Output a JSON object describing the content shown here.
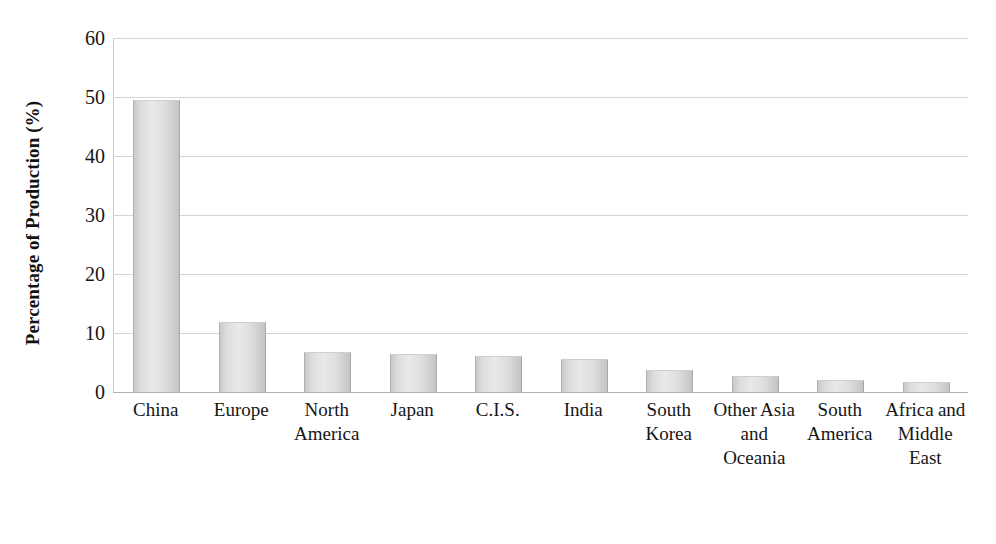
{
  "chart_data": {
    "type": "bar",
    "title": "",
    "subtitle": "",
    "xlabel": "",
    "ylabel": "Percentage of Production (%)",
    "categories": [
      "China",
      "Europe",
      "North America",
      "Japan",
      "C.I.S.",
      "India",
      "South Korea",
      "Other Asia and Oceania",
      "South America",
      "Africa and Middle East"
    ],
    "values": [
      49.3,
      11.7,
      6.6,
      6.2,
      5.9,
      5.4,
      3.5,
      2.6,
      1.8,
      1.5
    ],
    "ylim": [
      0,
      60
    ],
    "ytick_labels": [
      "0",
      "10",
      "20",
      "30",
      "40",
      "50",
      "60"
    ],
    "ytick_values": [
      0,
      10,
      20,
      30,
      40,
      50,
      60
    ],
    "grid": true,
    "grid_axis": "y",
    "legend": false,
    "legend_position": "none",
    "bar_fill_color": "#e0e0e0",
    "bar_edge_color": "#aaaaaa",
    "gridline_color": "#d4d4d4",
    "axis_color": "#b3b3b3",
    "background_color": "#ffffff",
    "text_color": "#161616"
  }
}
